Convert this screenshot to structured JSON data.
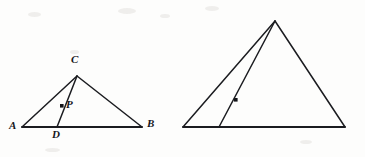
{
  "figure": {
    "stroke_color": "#1b1c20",
    "background_color": "#fdfdfc",
    "canvas": {
      "width": 365,
      "height": 157
    }
  },
  "triangles": [
    {
      "id": "triangle-left",
      "name": "triangle-ABC",
      "vertices": {
        "A": {
          "label": "A",
          "x": 22,
          "y": 127
        },
        "B": {
          "label": "B",
          "x": 142,
          "y": 127
        },
        "C": {
          "label": "C",
          "x": 77,
          "y": 76
        }
      },
      "foot": {
        "label": "D",
        "x": 57,
        "y": 127
      },
      "interior_point": {
        "label": "P",
        "x": 62,
        "y": 106
      },
      "edges": [
        {
          "name": "side-AB",
          "from": "A",
          "to": "B"
        },
        {
          "name": "side-AC",
          "from": "A",
          "to": "C"
        },
        {
          "name": "side-BC",
          "from": "B",
          "to": "C"
        },
        {
          "name": "cevian-CD",
          "from": "C",
          "to": "D"
        }
      ],
      "labels": {
        "A": {
          "text": "A",
          "x": 9,
          "y": 126
        },
        "B": {
          "text": "B",
          "x": 147,
          "y": 124
        },
        "C": {
          "text": "C",
          "x": 71,
          "y": 59
        },
        "D": {
          "text": "D",
          "x": 53,
          "y": 131
        },
        "P": {
          "text": "P",
          "x": 67,
          "y": 101
        }
      }
    },
    {
      "id": "triangle-right",
      "name": "triangle-A-prime-B-prime-C-prime",
      "vertices": {
        "A'": {
          "label": "A'",
          "x": 183,
          "y": 127
        },
        "B'": {
          "label": "B'",
          "x": 345,
          "y": 127
        },
        "C'": {
          "label": "C'",
          "x": 275,
          "y": 21
        }
      },
      "foot": {
        "label": "D'",
        "x": 219,
        "y": 127
      },
      "interior_point": {
        "label": "P'",
        "x": 236,
        "y": 100
      },
      "edges": [
        {
          "name": "side-A-prime-B-prime",
          "from": "A'",
          "to": "B'"
        },
        {
          "name": "side-A-prime-C-prime",
          "from": "A'",
          "to": "C'"
        },
        {
          "name": "side-B-prime-C-prime",
          "from": "B'",
          "to": "C'"
        },
        {
          "name": "cevian-C-prime-D-prime",
          "from": "C'",
          "to": "D'"
        }
      ],
      "labels": {
        "A'": {
          "text": "A'",
          "x": 168,
          "y": 126
        },
        "B'": {
          "text": "B'",
          "x": 350,
          "y": 124
        },
        "C'": {
          "text": "C'",
          "x": 269,
          "y": 4
        },
        "D'": {
          "text": "D'",
          "x": 213,
          "y": 131
        },
        "P'": {
          "text": "P'",
          "x": 242,
          "y": 95
        }
      }
    }
  ]
}
